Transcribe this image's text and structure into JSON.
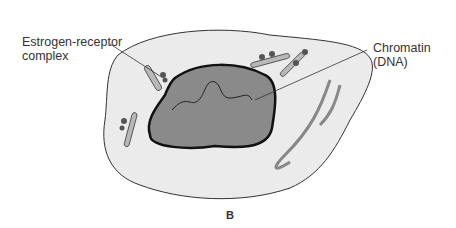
{
  "diagram": {
    "panel_label": "B",
    "labels": {
      "estrogen_receptor": [
        "Estrogen-receptor",
        "complex"
      ],
      "chromatin": [
        "Chromatin",
        "(DNA)"
      ]
    },
    "colors": {
      "cytoplasm": "#ebebeb",
      "nucleus": "#8a8a8a",
      "organelle": "#b8b8b8",
      "receptor": "#555555"
    }
  }
}
